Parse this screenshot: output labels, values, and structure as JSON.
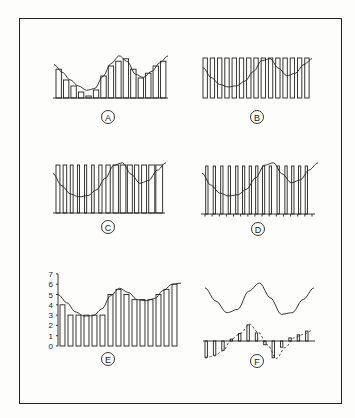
{
  "panels": [
    {
      "id": "A",
      "label": "A",
      "description": "Pulse amplitude samples following waveform",
      "bar_heights": [
        0.72,
        0.45,
        0.3,
        0.15,
        0.05,
        0.2,
        0.55,
        0.8,
        0.92,
        0.98,
        0.72,
        0.5,
        0.62,
        0.8,
        0.92
      ]
    },
    {
      "id": "B",
      "label": "B",
      "description": "Constant-amplitude pulses with waveform overlaid",
      "pulse_widths": [
        0.6,
        0.6,
        0.6,
        0.6,
        0.6,
        0.6,
        0.6,
        0.6,
        0.6,
        0.6,
        0.6,
        0.6,
        0.6,
        0.6,
        0.6
      ]
    },
    {
      "id": "C",
      "label": "C",
      "description": "Pulse width modulated samples",
      "pulse_widths": [
        0.55,
        0.5,
        0.4,
        0.3,
        0.3,
        0.35,
        0.45,
        0.6,
        0.75,
        0.8,
        0.7,
        0.6,
        0.7,
        0.85,
        0.95
      ]
    },
    {
      "id": "D",
      "label": "D",
      "description": "Pulse position modulated samples",
      "pulse_offsets": [
        0.1,
        0.15,
        0.2,
        0.25,
        0.3,
        0.25,
        0.2,
        0.1,
        0.05,
        0.0,
        0.1,
        0.2,
        0.15,
        0.1,
        0.05
      ]
    },
    {
      "id": "E",
      "label": "E",
      "description": "Quantized samples on 0-7 scale",
      "y_ticks": [
        "0",
        "1",
        "2",
        "3",
        "4",
        "5",
        "6",
        "7"
      ],
      "values": [
        4,
        3,
        3,
        3,
        3,
        3,
        5,
        5.5,
        5,
        4.5,
        4.5,
        4.5,
        5,
        5.5,
        6
      ]
    },
    {
      "id": "F",
      "label": "F",
      "description": "Differential samples with derivative curve (dashed)",
      "values": [
        -2.6,
        -2.3,
        -1.5,
        0.3,
        1.2,
        2.6,
        1.3,
        -0.6,
        -2.7,
        -1.0,
        0.5,
        1.0,
        1.6
      ]
    }
  ]
}
